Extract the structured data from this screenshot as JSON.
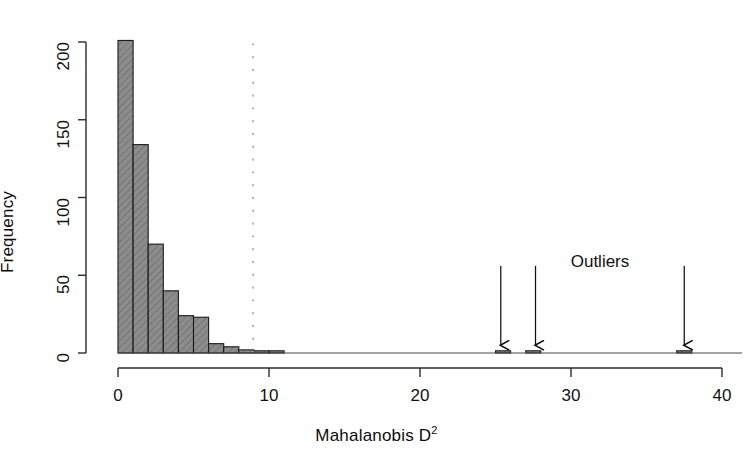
{
  "chart_data": {
    "type": "bar",
    "title": "",
    "subtitle": "",
    "xlabel": "Mahalanobis D",
    "xlabel_superscript": "2",
    "ylabel": "Frequency",
    "xlim": [
      0,
      40
    ],
    "ylim": [
      0,
      200
    ],
    "grid": false,
    "legend": null,
    "bin_width": 1,
    "bar_fill_color": "#8c8c8c",
    "bar_border_color": "#1a1a1a",
    "hatch": "diagonal-45",
    "x_ticks": [
      "0",
      "10",
      "20",
      "30",
      "40"
    ],
    "x_tick_values": [
      0,
      10,
      20,
      30,
      40
    ],
    "y_ticks": [
      "0",
      "50",
      "100",
      "150",
      "200"
    ],
    "y_tick_values": [
      0,
      50,
      100,
      150,
      200
    ],
    "categories": [
      "0-1",
      "1-2",
      "2-3",
      "3-4",
      "4-5",
      "5-6",
      "6-7",
      "7-8",
      "8-9",
      "9-10",
      "10-11",
      "25-26",
      "27-28",
      "37-38"
    ],
    "bin_starts": [
      0,
      1,
      2,
      3,
      4,
      5,
      6,
      7,
      8,
      9,
      10,
      25,
      27,
      37
    ],
    "values": [
      201,
      134,
      70,
      40,
      24,
      23,
      6,
      4,
      2,
      1,
      1,
      1,
      1,
      1
    ],
    "cutoff_line": {
      "x_value": 8.95,
      "style": "dotted",
      "color": "#9b9b9b",
      "label": ""
    },
    "annotations": [
      {
        "text": "Outliers",
        "x_value": 27.6,
        "y_value": 68,
        "name": "outliers-label"
      }
    ],
    "arrows": [
      {
        "x_value": 25.35,
        "y_top": 56,
        "y_bottom": 5,
        "name": "outlier-arrow-1"
      },
      {
        "x_value": 27.65,
        "y_value_label": "27.6",
        "y_top": 56,
        "y_bottom": 5,
        "name": "outlier-arrow-2"
      },
      {
        "x_value": 37.5,
        "y_top": 56,
        "y_bottom": 5,
        "name": "outlier-arrow-3"
      }
    ]
  }
}
